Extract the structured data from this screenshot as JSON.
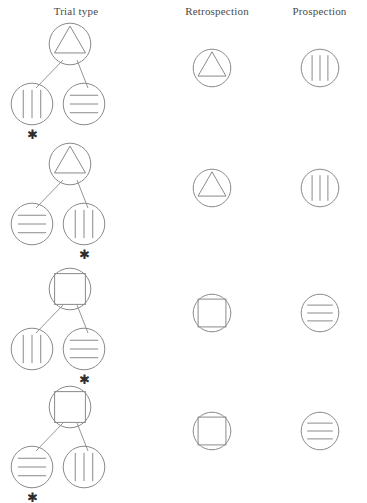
{
  "figure": {
    "headers": {
      "trial_type": "Trial type",
      "retrospection": "Retrospection",
      "prospection": "Prospection"
    },
    "asterisk_glyph": "✱",
    "colors": {
      "stroke": "#8a8a8a",
      "text": "#4a4a4a",
      "background": "#ffffff"
    },
    "icon_names": {
      "triangle": "triangle-in-circle-icon",
      "square": "square-in-circle-icon",
      "vertical": "vertical-lines-in-circle-icon",
      "horizontal": "horizontal-lines-in-circle-icon"
    }
  },
  "chart_data": {
    "type": "diagram",
    "columns": [
      "Trial type",
      "Retrospection",
      "Prospection"
    ],
    "rows": [
      {
        "index": 1,
        "tree": {
          "parent": "triangle",
          "left_child": "vertical",
          "right_child": "horizontal",
          "target": "left"
        },
        "retrospection": "triangle",
        "prospection": "vertical"
      },
      {
        "index": 2,
        "tree": {
          "parent": "triangle",
          "left_child": "horizontal",
          "right_child": "vertical",
          "target": "right"
        },
        "retrospection": "triangle",
        "prospection": "vertical"
      },
      {
        "index": 3,
        "tree": {
          "parent": "square",
          "left_child": "vertical",
          "right_child": "horizontal",
          "target": "right"
        },
        "retrospection": "square",
        "prospection": "horizontal"
      },
      {
        "index": 4,
        "tree": {
          "parent": "square",
          "left_child": "horizontal",
          "right_child": "vertical",
          "target": "left"
        },
        "retrospection": "square",
        "prospection": "horizontal"
      }
    ]
  }
}
